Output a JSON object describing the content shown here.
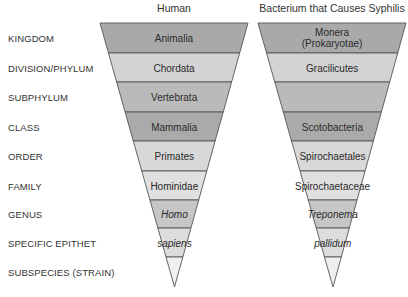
{
  "columns": [
    {
      "title": "Human",
      "top_left_x": 100,
      "top_right_x": 248,
      "apex_x": 174.5,
      "cells": [
        {
          "text": "Animalia",
          "italic": false
        },
        {
          "text": "Chordata",
          "italic": false
        },
        {
          "text": "Vertebrata",
          "italic": false
        },
        {
          "text": "Mammalia",
          "italic": false
        },
        {
          "text": "Primates",
          "italic": false
        },
        {
          "text": "Hominidae",
          "italic": false
        },
        {
          "text": "Homo",
          "italic": true
        },
        {
          "text": "sapiens",
          "italic": true
        },
        {
          "text": "",
          "italic": false
        }
      ]
    },
    {
      "title": "Bacterium that Causes Syphilis",
      "top_left_x": 258,
      "top_right_x": 406,
      "apex_x": 333,
      "cells": [
        {
          "text": "Monera\n(Prokaryotae)",
          "italic": false
        },
        {
          "text": "Gracilicutes",
          "italic": false
        },
        {
          "text": "",
          "italic": false
        },
        {
          "text": "Scotobacteria",
          "italic": false
        },
        {
          "text": "Spirochaetales",
          "italic": false
        },
        {
          "text": "Spirochaetaceae",
          "italic": false
        },
        {
          "text": "Treponema",
          "italic": true
        },
        {
          "text": "pallidum",
          "italic": true
        },
        {
          "text": "",
          "italic": false
        }
      ]
    }
  ],
  "ranks": [
    "KINGDOM",
    "DIVISION/PHYLUM",
    "SUBPHYLUM",
    "CLASS",
    "ORDER",
    "FAMILY",
    "GENUS",
    "SPECIFIC EPITHET",
    "SUBSPECIES (STRAIN)"
  ],
  "band_boundaries_y": [
    23,
    53,
    82,
    112,
    141,
    171,
    200,
    228,
    257,
    287
  ],
  "band_colors": [
    "#a9a9a9",
    "#d3d3d3",
    "#bababa",
    "#aaaaaa",
    "#d8d8d8",
    "#e0e0e0",
    "#c6c6c6",
    "#dcdcdc",
    "#efefef"
  ],
  "stroke_color": "#555555"
}
